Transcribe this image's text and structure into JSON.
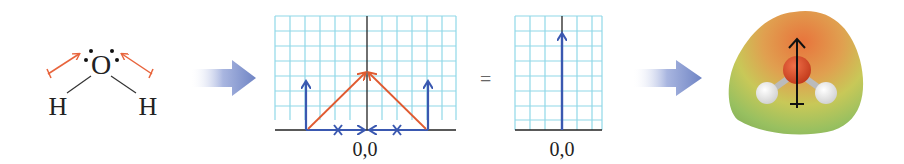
{
  "lewis": {
    "atom_center": "O",
    "atom_left": "H",
    "atom_right": "H",
    "bond_dipole_color": "#e8643c"
  },
  "arrow1": {
    "icon": "right-arrow-icon",
    "color": "#6f84c4"
  },
  "grid1": {
    "origin_label": "0,0",
    "grid_color": "#8fd8e8",
    "vector_color": "#3a58b0",
    "resultant_color": "#e05a30"
  },
  "equals": {
    "symbol": "="
  },
  "grid2": {
    "origin_label": "0,0",
    "vector_color": "#3a58b0"
  },
  "arrow2": {
    "icon": "right-arrow-icon",
    "color": "#6f84c4"
  },
  "model": {
    "description": "electrostatic potential map of water with net dipole arrow",
    "oxygen_color": "#d8441c",
    "hydrogen_color": "#f2f2f2"
  }
}
